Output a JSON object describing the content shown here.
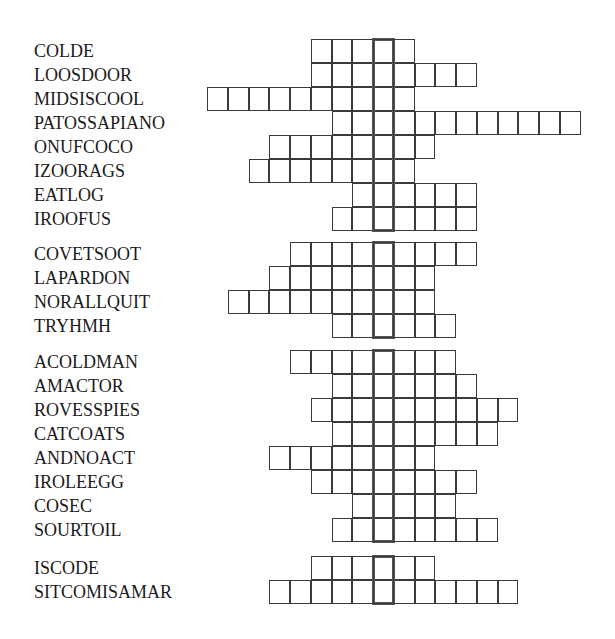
{
  "puzzle": {
    "grid": {
      "left": 207,
      "cell_width": 20.75,
      "row_height": 24,
      "highlight_col": 8
    },
    "groups": [
      {
        "top": 39,
        "rows": [
          {
            "clue": "COLDE",
            "start_col": 5,
            "length": 5
          },
          {
            "clue": "LOOSDOOR",
            "start_col": 5,
            "length": 8
          },
          {
            "clue": "MIDSISCOOL",
            "start_col": 0,
            "length": 10
          },
          {
            "clue": "PATOSSAPIANO",
            "start_col": 6,
            "length": 12
          },
          {
            "clue": "ONUFCOCO",
            "start_col": 3,
            "length": 8
          },
          {
            "clue": "IZOORAGS",
            "start_col": 2,
            "length": 8
          },
          {
            "clue": "EATLOG",
            "start_col": 7,
            "length": 6
          },
          {
            "clue": "IROOFUS",
            "start_col": 6,
            "length": 7
          }
        ]
      },
      {
        "top": 242,
        "rows": [
          {
            "clue": "COVETSOOT",
            "start_col": 4,
            "length": 9
          },
          {
            "clue": "LAPARDON",
            "start_col": 3,
            "length": 8
          },
          {
            "clue": "NORALLQUIT",
            "start_col": 1,
            "length": 10
          },
          {
            "clue": "TRYHMH",
            "start_col": 6,
            "length": 6
          }
        ]
      },
      {
        "top": 350,
        "rows": [
          {
            "clue": "ACOLDMAN",
            "start_col": 4,
            "length": 8
          },
          {
            "clue": "AMACTOR",
            "start_col": 6,
            "length": 7
          },
          {
            "clue": "ROVESSPIES",
            "start_col": 5,
            "length": 10
          },
          {
            "clue": "CATCOATS",
            "start_col": 6,
            "length": 8
          },
          {
            "clue": "ANDNOACT",
            "start_col": 3,
            "length": 8
          },
          {
            "clue": "IROLEEGG",
            "start_col": 5,
            "length": 8
          },
          {
            "clue": "COSEC",
            "start_col": 7,
            "length": 5
          },
          {
            "clue": "SOURTOIL",
            "start_col": 6,
            "length": 8
          }
        ]
      },
      {
        "top": 556,
        "rows": [
          {
            "clue": "ISCODE",
            "start_col": 5,
            "length": 6
          },
          {
            "clue": "SITCOMISAMAR",
            "start_col": 3,
            "length": 12
          }
        ]
      }
    ]
  }
}
